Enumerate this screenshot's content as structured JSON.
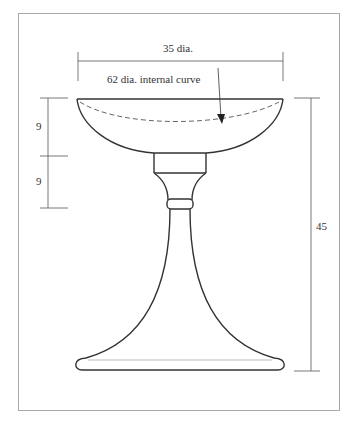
{
  "diagram": {
    "labels": {
      "rim_diameter": "35 dia.",
      "internal_curve": "62 dia. internal curve",
      "bowl_depth_upper": "9",
      "bowl_depth_lower": "9",
      "total_height": "45"
    },
    "colors": {
      "line": "#333333",
      "frame": "#9a9a9a",
      "dim": "#555555"
    }
  }
}
